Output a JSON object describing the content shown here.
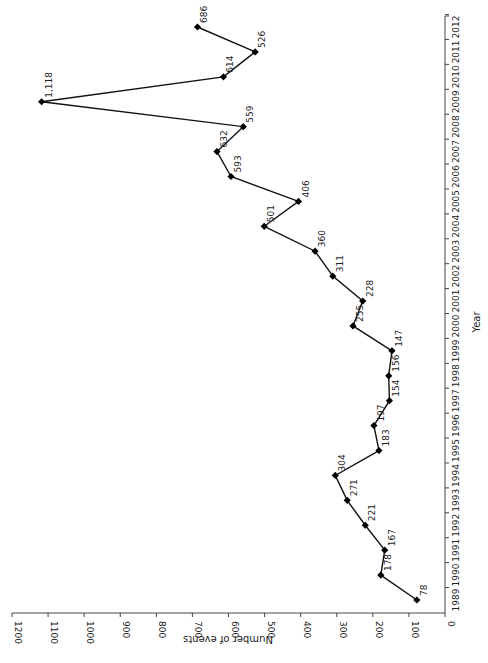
{
  "chart_data": {
    "type": "line",
    "orientation": "rotated-90-clockwise",
    "title": "",
    "xlabel": "Year",
    "ylabel": "Number of events",
    "x": [
      1989,
      1990,
      1991,
      1992,
      1993,
      1994,
      1995,
      1996,
      1997,
      1998,
      1999,
      2000,
      2001,
      2002,
      2003,
      2004,
      2005,
      2006,
      2007,
      2008,
      2009,
      2010,
      2011,
      2012
    ],
    "values": [
      78,
      178,
      167,
      221,
      271,
      304,
      183,
      197,
      154,
      156,
      147,
      255,
      228,
      311,
      360,
      501,
      406,
      593,
      632,
      559,
      1118,
      614,
      526,
      686
    ],
    "data_labels": [
      "78",
      "178",
      "167",
      "221",
      "271",
      "304",
      "183",
      "197",
      "154",
      "156",
      "147",
      "255",
      "228",
      "311",
      "360",
      "501",
      "406",
      "593",
      "632",
      "559",
      "1,118",
      "614",
      "526",
      "686"
    ],
    "ylim": [
      0,
      1200
    ],
    "y_ticks": [
      "0",
      "100",
      "200",
      "300",
      "400",
      "500",
      "600",
      "700",
      "800",
      "900",
      "1000",
      "1100",
      "1200"
    ],
    "x_ticks": [
      "1989",
      "1990",
      "1991",
      "1992",
      "1993",
      "1994",
      "1995",
      "1996",
      "1997",
      "1998",
      "1999",
      "2000",
      "2001",
      "2002",
      "2003",
      "2004",
      "2005",
      "2006",
      "2007",
      "2008",
      "2009",
      "2010",
      "2011",
      "2012"
    ],
    "marker": "diamond",
    "line_color": "#111111",
    "grid": false,
    "legend": null
  }
}
